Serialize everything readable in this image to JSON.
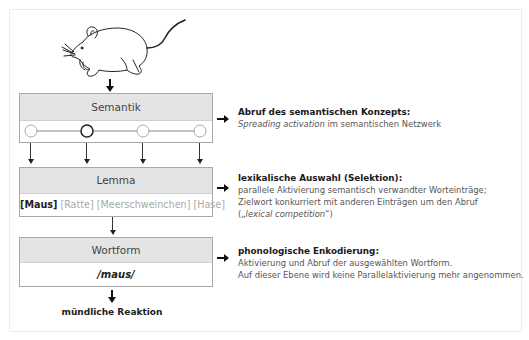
{
  "diagram": {
    "levels": [
      {
        "id": "semantik",
        "label": "Semantik",
        "nodes": 4,
        "active_node_index": 1,
        "description": {
          "title": "Abruf des semantischen Konzepts:",
          "line1_italic": "Spreading activation",
          "line1_rest": " im semantischen Netzwerk"
        }
      },
      {
        "id": "lemma",
        "label": "Lemma",
        "candidates": [
          {
            "text": "[Maus]",
            "selected": true
          },
          {
            "text": "[Ratte]",
            "selected": false
          },
          {
            "text": "[Meerschweinchen]",
            "selected": false
          },
          {
            "text": "[Hase]",
            "selected": false
          }
        ],
        "description": {
          "title": "lexikalische Auswahl (Selektion):",
          "line1": "parallele Aktivierung semantisch verwandter Worteinträge;",
          "line2": "Zielwort konkurriert mit anderen Einträgen um den Abruf",
          "line3_open": "(„",
          "line3_italic": "lexical competition",
          "line3_close": "“)"
        }
      },
      {
        "id": "wortform",
        "label": "Wortform",
        "value": "/maus/",
        "description": {
          "title": "phonologische Enkodierung:",
          "line1": "Aktivierung und Abruf der ausgewählten Wortform.",
          "line2": "Auf dieser Ebene wird keine Parallelaktivierung mehr angenommen."
        }
      }
    ],
    "input_icon": "mouse-illustration",
    "output_label": "mündliche Reaktion"
  },
  "colors": {
    "box_header": "#e4e4e4",
    "box_border": "#a8a8a8",
    "selected_text": "#222222",
    "unselected_text": "#aaaaaa"
  }
}
